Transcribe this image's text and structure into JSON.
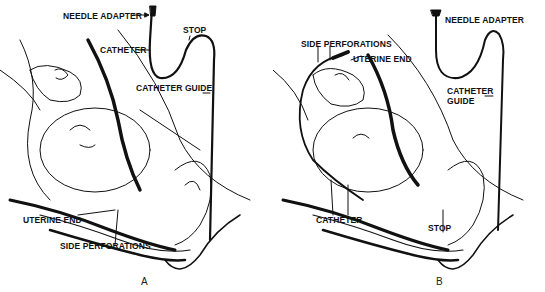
{
  "figure": {
    "panels": [
      {
        "id": "A",
        "letter": "A",
        "labels": {
          "needle_adapter": "NEEDLE ADAPTER",
          "catheter": "CATHETER",
          "stop": "STOP",
          "catheter_guide": "CATHETER GUIDE",
          "uterine_end": "UTERINE END",
          "side_perforations": "SIDE PERFORATIONS"
        }
      },
      {
        "id": "B",
        "letter": "B",
        "labels": {
          "needle_adapter": "NEEDLE ADAPTER",
          "side_perforations": "SIDE PERFORATIONS",
          "uterine_end": "UTERINE END",
          "catheter_guide_line1": "CATHETER",
          "catheter_guide_line2": "GUIDE",
          "catheter": "CATHETER",
          "stop": "STOP"
        }
      }
    ],
    "colors": {
      "ink": "#111111",
      "background": "#ffffff"
    }
  }
}
